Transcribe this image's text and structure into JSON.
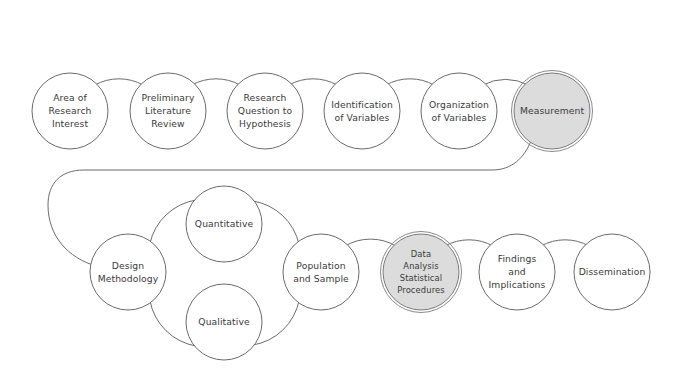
{
  "diagram": {
    "background_color": "#ffffff",
    "stroke_color": "#6b6b6b",
    "text_color": "#3a3a3a",
    "highlight_fill": "#dcdcdc",
    "rows": [
      {
        "name": "top-row",
        "nodes": [
          {
            "id": "area-of-research-interest",
            "lines": [
              "Area of",
              "Research",
              "Interest"
            ],
            "cx": 70,
            "cy": 111,
            "r": 38,
            "highlighted": false
          },
          {
            "id": "preliminary-literature-review",
            "lines": [
              "Preliminary",
              "Literature",
              "Review"
            ],
            "cx": 168,
            "cy": 111,
            "r": 38,
            "highlighted": false
          },
          {
            "id": "research-question-to-hypothesis",
            "lines": [
              "Research",
              "Question to",
              "Hypothesis"
            ],
            "cx": 265,
            "cy": 111,
            "r": 38,
            "highlighted": false
          },
          {
            "id": "identification-of-variables",
            "lines": [
              "Identification",
              "of Variables"
            ],
            "cx": 362,
            "cy": 111,
            "r": 38,
            "highlighted": false
          },
          {
            "id": "organization-of-variables",
            "lines": [
              "Organization",
              "of Variables"
            ],
            "cx": 459,
            "cy": 111,
            "r": 38,
            "highlighted": false
          },
          {
            "id": "measurement",
            "lines": [
              "Measurement"
            ],
            "cx": 552,
            "cy": 111,
            "r": 38,
            "highlighted": true
          }
        ]
      },
      {
        "name": "bottom-row",
        "nodes": [
          {
            "id": "design-methodology",
            "lines": [
              "Design",
              "Methodology"
            ],
            "cx": 128,
            "cy": 272,
            "r": 38,
            "highlighted": false
          },
          {
            "id": "quantitative",
            "lines": [
              "Quantitative"
            ],
            "cx": 224,
            "cy": 224,
            "r": 38,
            "highlighted": false
          },
          {
            "id": "qualitative",
            "lines": [
              "Qualitative"
            ],
            "cx": 224,
            "cy": 322,
            "r": 38,
            "highlighted": false
          },
          {
            "id": "population-and-sample",
            "lines": [
              "Population",
              "and Sample"
            ],
            "cx": 321,
            "cy": 272,
            "r": 38,
            "highlighted": false
          },
          {
            "id": "data-analysis-statistical-procedures",
            "lines": [
              "Data",
              "Analysis",
              "Statistical",
              "Procedures"
            ],
            "cx": 421,
            "cy": 272,
            "r": 38,
            "highlighted": true
          },
          {
            "id": "findings-and-implications",
            "lines": [
              "Findings",
              "and",
              "Implications"
            ],
            "cx": 517,
            "cy": 272,
            "r": 38,
            "highlighted": false
          },
          {
            "id": "dissemination",
            "lines": [
              "Dissemination"
            ],
            "cx": 612,
            "cy": 272,
            "r": 38,
            "highlighted": false
          }
        ]
      }
    ],
    "connectors": [
      {
        "id": "area-to-preliminary",
        "path": "M 95 85 A 49 49 0 0 1 143 85"
      },
      {
        "id": "preliminary-to-research-question",
        "path": "M 192 85 A 49 49 0 0 1 240 85"
      },
      {
        "id": "research-question-to-identification",
        "path": "M 289 85 A 49 49 0 0 1 337 85"
      },
      {
        "id": "identification-to-organization",
        "path": "M 386 85 A 49 49 0 0 1 434 85"
      },
      {
        "id": "organization-to-measurement",
        "path": "M 483 85 A 47 47 0 0 1 528 85"
      },
      {
        "id": "measurement-to-design-methodology",
        "path": "M 531 141 C 524 158 512 170 492 170 L 84 170 C 60 170 48 184 48 205 C 48 236 68 258 96 266"
      },
      {
        "id": "design-to-quantitative",
        "path": "M 150 243 A 56 56 0 0 1 196 200"
      },
      {
        "id": "design-to-qualitative",
        "path": "M 150 301 A 56 56 0 0 0 196 346"
      },
      {
        "id": "quantitative-to-population",
        "path": "M 253 201 A 56 56 0 0 1 299 244"
      },
      {
        "id": "qualitative-to-population",
        "path": "M 253 345 A 56 56 0 0 0 299 301"
      },
      {
        "id": "population-to-data-analysis",
        "path": "M 345 246 A 50 50 0 0 1 396 246"
      },
      {
        "id": "data-analysis-to-findings",
        "path": "M 445 246 A 49 49 0 0 1 493 246"
      },
      {
        "id": "findings-to-dissemination",
        "path": "M 541 246 A 49 49 0 0 1 589 246"
      }
    ]
  }
}
